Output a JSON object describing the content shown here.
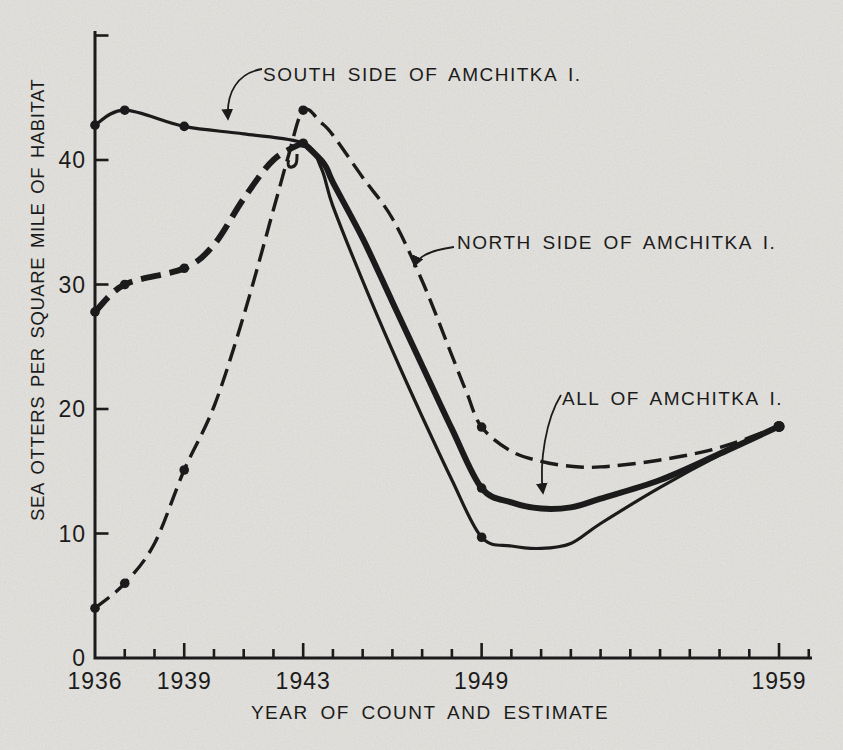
{
  "figure": {
    "background_color": "#e9e8e4",
    "ink_color": "#1b1b1b"
  },
  "chart_data": {
    "type": "line",
    "title": "",
    "xlabel": "YEAR OF COUNT AND ESTIMATE",
    "ylabel": "SEA OTTERS PER SQUARE MILE OF HABITAT",
    "xlim": [
      1936,
      1960
    ],
    "ylim": [
      0,
      50
    ],
    "y_ticks": [
      0,
      10,
      20,
      30,
      40
    ],
    "y_top_tick": 50,
    "x_labeled_years": [
      1936,
      1939,
      1943,
      1949,
      1959
    ],
    "x_tick_labels": [
      "1936",
      "1939",
      "1943",
      "1949",
      "1959"
    ],
    "x_minor_year_range": [
      1937,
      1960
    ],
    "grid": false,
    "legend_position": "inline-annotations",
    "series": [
      {
        "name": "SOUTH SIDE OF AMCHITKA I.",
        "line_style": "solid-thin",
        "segments": [
          {
            "style": "solid-thin",
            "points": [
              [
                1936,
                42.8
              ],
              [
                1937,
                44.0
              ],
              [
                1939,
                42.7
              ],
              [
                1941,
                42.1
              ],
              [
                1943,
                41.35
              ],
              [
                1943.6,
                39.4
              ],
              [
                1944,
                36.3
              ],
              [
                1945,
                30.3
              ],
              [
                1946,
                24.7
              ],
              [
                1947,
                19.4
              ],
              [
                1948,
                14.3
              ],
              [
                1949,
                9.7
              ],
              [
                1950,
                9.0
              ],
              [
                1951,
                8.8
              ],
              [
                1952,
                9.2
              ],
              [
                1953,
                10.8
              ],
              [
                1955,
                13.7
              ],
              [
                1957,
                16.3
              ],
              [
                1959,
                18.6
              ]
            ]
          }
        ],
        "markers": [
          [
            1936,
            42.8
          ],
          [
            1937,
            44.0
          ],
          [
            1939,
            42.7
          ],
          [
            1943,
            41.35
          ],
          [
            1949,
            9.7
          ],
          [
            1959,
            18.6
          ]
        ]
      },
      {
        "name": "ALL OF AMCHITKA I.",
        "line_style": "thick (dash-dot before 1943, solid after)",
        "segments": [
          {
            "style": "dashdot-thick",
            "points": [
              [
                1936,
                27.8
              ],
              [
                1937,
                30.0
              ],
              [
                1939,
                31.3
              ],
              [
                1940,
                33.2
              ],
              [
                1941,
                36.9
              ],
              [
                1942,
                40.0
              ],
              [
                1943,
                41.4
              ]
            ]
          },
          {
            "style": "solid-thick",
            "points": [
              [
                1943,
                41.4
              ],
              [
                1943.7,
                39.7
              ],
              [
                1944,
                38.2
              ],
              [
                1945,
                33.7
              ],
              [
                1946,
                28.6
              ],
              [
                1947,
                23.5
              ],
              [
                1948,
                18.4
              ],
              [
                1949,
                13.65
              ],
              [
                1950,
                12.5
              ],
              [
                1951,
                12.0
              ],
              [
                1952,
                12.1
              ],
              [
                1953,
                12.8
              ],
              [
                1955,
                14.3
              ],
              [
                1957,
                16.4
              ],
              [
                1959,
                18.6
              ]
            ]
          }
        ],
        "markers": [
          [
            1936,
            27.8
          ],
          [
            1937,
            30.0
          ],
          [
            1939,
            31.3
          ],
          [
            1949,
            13.65
          ]
        ]
      },
      {
        "name": "NORTH SIDE OF AMCHITKA I.",
        "line_style": "dashed",
        "segments": [
          {
            "style": "dashed",
            "points": [
              [
                1936,
                4.0
              ],
              [
                1937,
                6.0
              ],
              [
                1938,
                9.2
              ],
              [
                1939,
                15.1
              ],
              [
                1940,
                20.2
              ],
              [
                1941,
                27.5
              ],
              [
                1942,
                36.0
              ],
              [
                1942.5,
                40.3
              ],
              [
                1943,
                44.0
              ],
              [
                1943.6,
                43.0
              ],
              [
                1944,
                42.0
              ],
              [
                1945,
                38.6
              ],
              [
                1946,
                35.3
              ],
              [
                1947,
                30.3
              ],
              [
                1948,
                24.3
              ],
              [
                1948.5,
                21.3
              ],
              [
                1949,
                18.55
              ],
              [
                1950,
                16.6
              ],
              [
                1951,
                15.8
              ],
              [
                1952,
                15.4
              ],
              [
                1953,
                15.35
              ],
              [
                1955,
                15.9
              ],
              [
                1957,
                16.9
              ],
              [
                1959,
                18.6
              ]
            ]
          }
        ],
        "markers": [
          [
            1936,
            4.0
          ],
          [
            1937,
            6.0
          ],
          [
            1939,
            15.1
          ],
          [
            1943,
            44.0
          ],
          [
            1949,
            18.55
          ],
          [
            1959,
            18.6
          ]
        ]
      }
    ],
    "annotations": [
      {
        "text": "SOUTH SIDE OF AMCHITKA I.",
        "points_to": "solid-thin line near 1940"
      },
      {
        "text": "NORTH SIDE OF AMCHITKA I.",
        "points_to": "dashed line descending after 1943"
      },
      {
        "text": "ALL OF AMCHITKA I.",
        "points_to": "thick line near its 1950 minimum"
      }
    ]
  }
}
